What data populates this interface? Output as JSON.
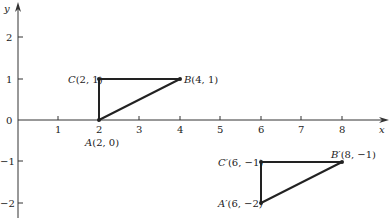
{
  "diagram": {
    "type": "coordinate-plane-translation",
    "axes": {
      "x_label": "x",
      "y_label": "y",
      "x_ticks": [
        "1",
        "2",
        "3",
        "4",
        "5",
        "6",
        "7",
        "8"
      ],
      "y_ticks_positive": [
        "1",
        "2"
      ],
      "y_ticks_negative": [
        "−1",
        "−2"
      ],
      "origin_label": "0"
    },
    "triangle_original": {
      "points": [
        {
          "name": "A",
          "x": 2,
          "y": 0,
          "label_letter": "A",
          "label_coords": "(2, 0)"
        },
        {
          "name": "B",
          "x": 4,
          "y": 1,
          "label_letter": "B",
          "label_coords": "(4, 1)"
        },
        {
          "name": "C",
          "x": 2,
          "y": 1,
          "label_letter": "C",
          "label_coords": "(2, 1)"
        }
      ]
    },
    "triangle_image": {
      "points": [
        {
          "name": "A'",
          "x": 6,
          "y": -2,
          "label_letter": "A′",
          "label_coords": "(6, −2)"
        },
        {
          "name": "B'",
          "x": 8,
          "y": -1,
          "label_letter": "B′",
          "label_coords": "(8, −1)"
        },
        {
          "name": "C'",
          "x": 6,
          "y": -1,
          "label_letter": "C′",
          "label_coords": "(6, −1)"
        }
      ]
    },
    "colors": {
      "stroke": "#222222",
      "background": "#ffffff"
    }
  }
}
